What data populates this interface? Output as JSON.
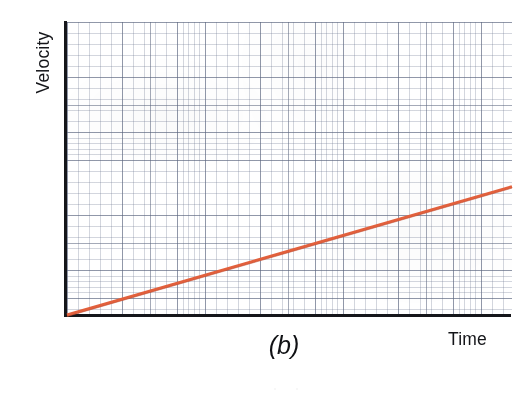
{
  "figure": {
    "caption": "(b)",
    "background_color": "#ffffff",
    "axis_color": "#15161a",
    "line_color": "#e2603c",
    "grid_major_color": "#5a647d",
    "grid_minor_color": "#6e7891"
  },
  "labels": {
    "y_axis": "Velocity",
    "x_axis": "Time"
  },
  "chart_data": {
    "type": "line",
    "title": "",
    "subtitle": "",
    "xlabel": "Time",
    "ylabel": "Velocity",
    "caption": "(b)",
    "xlim": [
      0,
      16
    ],
    "ylim": [
      0,
      10.5
    ],
    "x_tick_labels": [],
    "y_tick_labels": [],
    "grid": true,
    "grid_style": "graph-paper",
    "grid_major_divisions_x": 16,
    "grid_major_divisions_y": 10,
    "grid_minor_per_major": 5,
    "legend": false,
    "legend_position": "none",
    "annotations": [
      "(b)"
    ],
    "series": [
      {
        "name": "velocity",
        "color": "#e2603c",
        "line_width": 3,
        "style": "solid",
        "description": "straight line of constant positive slope through the origin (uniform acceleration)",
        "intercept": 0,
        "slope": 0.2875,
        "x": [
          0,
          2,
          4,
          6,
          8,
          10,
          12,
          14,
          16
        ],
        "values": [
          0.0,
          0.58,
          1.15,
          1.73,
          2.3,
          2.88,
          3.45,
          4.03,
          4.6
        ]
      }
    ]
  }
}
